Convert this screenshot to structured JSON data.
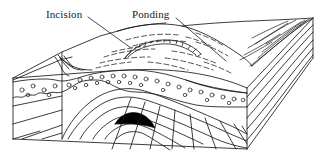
{
  "figure": {
    "type": "geological-block-diagram",
    "background_color": "#ffffff",
    "line_color": "#1a1a1a",
    "fill_dark_core": "#000000",
    "width": 321,
    "height": 151
  },
  "labels": {
    "incision": {
      "text": "Incision",
      "x": 46,
      "y": 8,
      "leader_from_x": 88,
      "leader_from_y": 17,
      "leader_to_x": 131,
      "leader_to_y": 48
    },
    "ponding": {
      "text": "Ponding",
      "x": 132,
      "y": 8,
      "leader_from_x": 176,
      "leader_from_y": 18,
      "leader_to_x": 226,
      "leader_to_y": 61
    }
  },
  "features": {
    "hachure_count": 14,
    "gravel_clast_count": 34,
    "fold_layer_count": 6,
    "top_contour_count": 13,
    "right_flank_line_count": 9,
    "block_corners": {
      "front_left_x": 13,
      "front_left_y": 78,
      "front_right_x": 247,
      "front_right_y": 88,
      "bottom_left_y": 139,
      "bottom_right_y": 149,
      "far_right_x": 313,
      "far_right_y": 18
    }
  }
}
